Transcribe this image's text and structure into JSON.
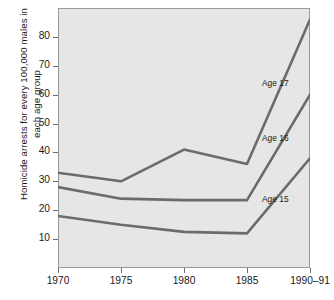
{
  "chart_data": {
    "type": "line",
    "title": "",
    "xlabel": "",
    "ylabel": "Homicide arrests for every 100,000 males in each age group",
    "x": [
      "1970",
      "1975",
      "1980",
      "1985",
      "1990–91"
    ],
    "xtick_labels": [
      "1970",
      "1975",
      "1980",
      "1985",
      "1990–91"
    ],
    "ytick_labels": [
      "10",
      "20",
      "30",
      "40",
      "50",
      "60",
      "70",
      "80"
    ],
    "ytick_values": [
      10,
      20,
      30,
      40,
      50,
      60,
      70,
      80
    ],
    "ylim": [
      0,
      90
    ],
    "grid": false,
    "legend_position": "inline-right",
    "series": [
      {
        "name": "Age 17",
        "label": "Age 17",
        "values": [
          33,
          30,
          41,
          36,
          86
        ],
        "color": "#6b6b6b"
      },
      {
        "name": "Age 16",
        "label": "Age 16",
        "values": [
          28,
          24,
          23.5,
          23.5,
          60
        ],
        "color": "#6b6b6b"
      },
      {
        "name": "Age 15",
        "label": "Age 15",
        "values": [
          18,
          15,
          12.5,
          12,
          38
        ],
        "color": "#6b6b6b"
      }
    ],
    "annotations": [
      {
        "text": "Age 17",
        "x": 4,
        "y": 64
      },
      {
        "text": "Age 16",
        "x": 4,
        "y": 45
      },
      {
        "text": "Age 15",
        "x": 4,
        "y": 24
      }
    ],
    "style": {
      "plot_background": "#e6e6e6",
      "frame_color": "#9a9a9a",
      "line_color": "#6b6b6b",
      "text_color": "#1a1a1a"
    }
  }
}
